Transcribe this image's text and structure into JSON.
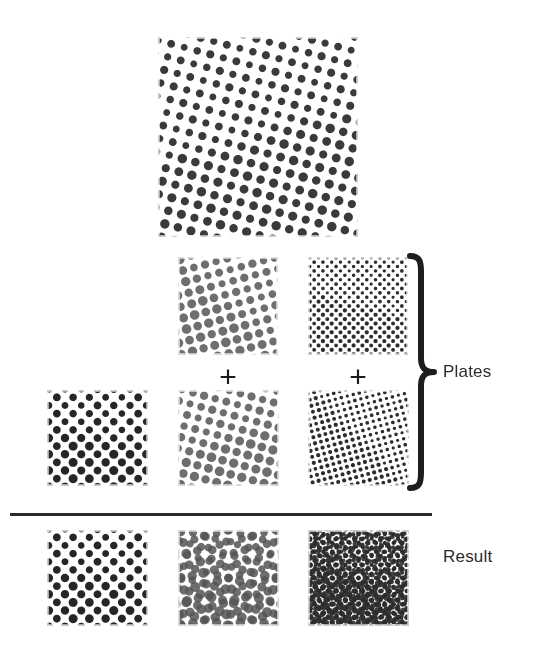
{
  "figure": {
    "title_text": "",
    "background_color": "#ffffff",
    "ink_color": "#2b2b2b"
  },
  "labels": {
    "plates": "Plates",
    "result": "Result",
    "plus_one": "+",
    "plus_two": "+"
  },
  "divider": {
    "x": 10,
    "y": 513,
    "width": 422,
    "height": 3,
    "color": "#2b2b2b"
  },
  "brace": {
    "name": "plates-brace",
    "x": 404,
    "y": 252,
    "width": 34,
    "height": 240,
    "color": "#1d1d1d"
  },
  "label_positions": {
    "plates": {
      "x": 443,
      "y": 363
    },
    "result": {
      "x": 443,
      "y": 548
    }
  },
  "plus_positions": [
    {
      "x": 206,
      "y": 362,
      "width": 44,
      "font_size": 30
    },
    {
      "x": 336,
      "y": 362,
      "width": 44,
      "font_size": 30
    }
  ],
  "swatches": [
    {
      "id": "overview-combined",
      "name": "halftone-overview-combined",
      "role": "overview",
      "caption": "",
      "x": 158,
      "y": 37,
      "width": 200,
      "height": 200,
      "layers": [
        {
          "angle": 15,
          "pitch": 13.5,
          "radius": 4.5,
          "color": "#3a3a3a",
          "opacity": 1
        }
      ]
    },
    {
      "id": "plate-mid-gray",
      "name": "halftone-plate-medium-gray-coarse",
      "role": "plate",
      "row": "top-plates",
      "column": 2,
      "x": 178,
      "y": 257,
      "width": 100,
      "height": 98,
      "layers": [
        {
          "angle": 75,
          "pitch": 11.5,
          "radius": 4.6,
          "color": "#6e6e6e",
          "opacity": 1
        }
      ]
    },
    {
      "id": "plate-fine-dark",
      "name": "halftone-plate-dark-fine",
      "role": "plate",
      "row": "top-plates",
      "column": 3,
      "x": 308,
      "y": 257,
      "width": 100,
      "height": 98,
      "layers": [
        {
          "angle": 45,
          "pitch": 6.2,
          "radius": 2.0,
          "color": "#2d2d2d",
          "opacity": 1
        }
      ]
    },
    {
      "id": "plate-dark-coarse",
      "name": "halftone-plate-dark-coarse",
      "role": "plate",
      "row": "bottom-plates",
      "column": 1,
      "x": 47,
      "y": 390,
      "width": 101,
      "height": 96,
      "layers": [
        {
          "angle": 45,
          "pitch": 11.5,
          "radius": 4.3,
          "color": "#262626",
          "opacity": 1
        }
      ]
    },
    {
      "id": "plate-mid-gray-2",
      "name": "halftone-plate-medium-gray-coarse-2",
      "role": "plate",
      "row": "bottom-plates",
      "column": 2,
      "x": 178,
      "y": 390,
      "width": 101,
      "height": 96,
      "layers": [
        {
          "angle": 15,
          "pitch": 11.5,
          "radius": 4.6,
          "color": "#6e6e6e",
          "opacity": 1
        }
      ]
    },
    {
      "id": "plate-fine-dark-2",
      "name": "halftone-plate-dark-fine-2",
      "role": "plate",
      "row": "bottom-plates",
      "column": 3,
      "x": 308,
      "y": 390,
      "width": 101,
      "height": 96,
      "layers": [
        {
          "angle": 75,
          "pitch": 6.2,
          "radius": 2.0,
          "color": "#2d2d2d",
          "opacity": 1
        }
      ]
    },
    {
      "id": "result-single",
      "name": "halftone-result-single-plate",
      "role": "result",
      "row": "results",
      "column": 1,
      "x": 47,
      "y": 530,
      "width": 101,
      "height": 96,
      "layers": [
        {
          "angle": 45,
          "pitch": 11.5,
          "radius": 4.3,
          "color": "#262626",
          "opacity": 1
        }
      ]
    },
    {
      "id": "result-double",
      "name": "halftone-result-two-plates-moire",
      "role": "result",
      "row": "results",
      "column": 2,
      "x": 178,
      "y": 530,
      "width": 101,
      "height": 96,
      "layers": [
        {
          "angle": 75,
          "pitch": 11.5,
          "radius": 4.8,
          "color": "#6e6e6e",
          "opacity": 1
        },
        {
          "angle": 15,
          "pitch": 11.5,
          "radius": 4.8,
          "color": "#555555",
          "opacity": 0.85
        }
      ]
    },
    {
      "id": "result-triple",
      "name": "halftone-result-three-plates-moire",
      "role": "result",
      "row": "results",
      "column": 3,
      "x": 308,
      "y": 530,
      "width": 101,
      "height": 96,
      "layers": [
        {
          "angle": 45,
          "pitch": 6.2,
          "radius": 2.6,
          "color": "#2d2d2d",
          "opacity": 1
        },
        {
          "angle": 75,
          "pitch": 6.2,
          "radius": 2.6,
          "color": "#2d2d2d",
          "opacity": 0.95
        },
        {
          "angle": 15,
          "pitch": 6.4,
          "radius": 2.4,
          "color": "#2d2d2d",
          "opacity": 0.9
        }
      ]
    }
  ]
}
